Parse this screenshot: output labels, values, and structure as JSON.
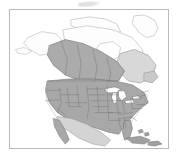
{
  "figure": {
    "kind": "thematic-reference-map",
    "title": "",
    "caption": "",
    "frame_border_color": "#b9b9b9",
    "background_color": "#ffffff"
  },
  "map": {
    "region_name": "North America",
    "projection_hint": "conic",
    "ocean_color": "#ffffff",
    "coastline_color": "#9a9a9a",
    "internal_border_color": "#6f6f6f",
    "shaded_fill_color": "#a8a8a8",
    "light_fill_color": "#d2d2d2",
    "unshaded_fill_color": "#fdfdfd",
    "lake_fill_color": "#ffffff",
    "legend_visible": false,
    "labels_visible": false,
    "graticule_visible": false,
    "areas": [
      {
        "name": "United States (contiguous)",
        "fill": "shaded",
        "subdivisions_visible": true
      },
      {
        "name": "Canada (southern provinces)",
        "fill": "shaded",
        "subdivisions_visible": true
      },
      {
        "name": "Canada (northern territories)",
        "fill": "unshaded",
        "subdivisions_visible": true
      },
      {
        "name": "Alaska",
        "fill": "unshaded",
        "subdivisions_visible": false
      },
      {
        "name": "Mexico",
        "fill": "light",
        "subdivisions_visible": false
      },
      {
        "name": "Baja California",
        "fill": "shaded",
        "subdivisions_visible": false
      },
      {
        "name": "Cuba",
        "fill": "shaded",
        "subdivisions_visible": false
      },
      {
        "name": "Hispaniola",
        "fill": "shaded",
        "subdivisions_visible": false
      },
      {
        "name": "Greenland (partial)",
        "fill": "unshaded",
        "subdivisions_visible": false
      },
      {
        "name": "Great Lakes",
        "fill": "water",
        "subdivisions_visible": false
      }
    ]
  }
}
